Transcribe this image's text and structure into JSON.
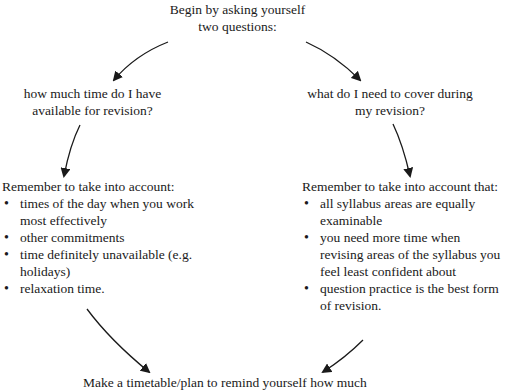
{
  "top": {
    "line1": "Begin by asking yourself",
    "line2": "two questions:"
  },
  "left_question": {
    "line1": "how much time do I have",
    "line2": "available for revision?"
  },
  "right_question": {
    "line1": "what do I need to cover during",
    "line2": "my revision?"
  },
  "left_list": {
    "heading": "Remember to take into account:",
    "items": [
      "times of the day when you work most effectively",
      "other commitments",
      "time definitely unavailable (e.g. holidays)",
      "relaxation time."
    ]
  },
  "right_list": {
    "heading": "Remember to take into account that:",
    "items": [
      "all syllabus areas are equally examinable",
      "you need more time when revising areas of the syllabus you feel least confident about",
      "question practice is the best form of revision."
    ]
  },
  "bottom": {
    "line1": "Make a timetable/plan to remind yourself how much"
  }
}
